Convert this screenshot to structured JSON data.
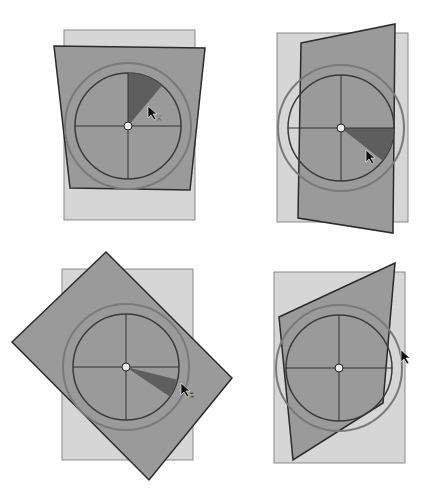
{
  "figure": {
    "colors": {
      "background": "#ffffff",
      "page_original_fill": "#d6d6d6",
      "page_original_stroke": "#8a8a8a",
      "page_transformed_fill": "#9a9a9a",
      "page_transformed_stroke": "#2a2a2a",
      "dial_ring": "#7a7a7a",
      "dial_inner": "#3a3a3a",
      "wedge_fill": "#5e5e5e",
      "crosshair": "#333333",
      "cursor": "#111111"
    }
  },
  "panels": [
    {
      "id": "top-left",
      "original_rect": [
        64,
        30,
        131,
        190
      ],
      "transformed_quad": [
        [
          54,
          46
        ],
        [
          205,
          48
        ],
        [
          190,
          190
        ],
        [
          70,
          188
        ]
      ],
      "dial": {
        "cx": 128,
        "cy": 126,
        "outer_r": 63,
        "inner_r": 53
      },
      "wedge": {
        "start_deg": -90,
        "end_deg": -50
      },
      "cursor": {
        "x": 148,
        "y": 106,
        "glyph": "x"
      }
    },
    {
      "id": "top-right",
      "original_rect": [
        277,
        33,
        131,
        189
      ],
      "transformed_quad": [
        [
          301,
          43
        ],
        [
          395,
          24
        ],
        [
          393,
          233
        ],
        [
          298,
          218
        ]
      ],
      "dial": {
        "cx": 341,
        "cy": 128,
        "outer_r": 63,
        "inner_r": 53
      },
      "wedge": {
        "start_deg": 0,
        "end_deg": 38
      },
      "cursor": {
        "x": 366,
        "y": 150,
        "glyph": ""
      }
    },
    {
      "id": "bottom-left",
      "original_rect": [
        62,
        269,
        131,
        191
      ],
      "transformed_quad": [
        [
          106,
          252
        ],
        [
          232,
          378
        ],
        [
          149,
          480
        ],
        [
          12,
          342
        ]
      ],
      "dial": {
        "cx": 126,
        "cy": 367,
        "outer_r": 63,
        "inner_r": 53
      },
      "wedge": {
        "start_deg": 14,
        "end_deg": 34
      },
      "cursor": {
        "x": 181,
        "y": 383,
        "glyph": "z"
      }
    },
    {
      "id": "bottom-right",
      "original_rect": [
        274,
        272,
        131,
        191
      ],
      "transformed_quad": [
        [
          279,
          317
        ],
        [
          395,
          263
        ],
        [
          383,
          403
        ],
        [
          293,
          460
        ]
      ],
      "dial": {
        "cx": 339,
        "cy": 368,
        "outer_r": 63,
        "inner_r": 53
      },
      "wedge": null,
      "cursor": {
        "x": 401,
        "y": 350,
        "glyph": ""
      }
    }
  ]
}
